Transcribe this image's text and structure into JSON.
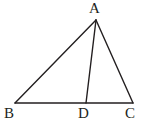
{
  "figure": {
    "type": "geometry-diagram",
    "background_color": "#ffffff",
    "stroke_color": "#231f20",
    "stroke_width": 1.4,
    "canvas": {
      "width": 145,
      "height": 126
    },
    "points": [
      {
        "id": "A",
        "label": "A",
        "x": 96,
        "y": 20,
        "label_x": 89,
        "label_y": 1
      },
      {
        "id": "B",
        "label": "B",
        "x": 15,
        "y": 103,
        "label_x": 4,
        "label_y": 106
      },
      {
        "id": "D",
        "label": "D",
        "x": 86,
        "y": 103,
        "label_x": 78,
        "label_y": 106
      },
      {
        "id": "C",
        "label": "C",
        "x": 133,
        "y": 103,
        "label_x": 125,
        "label_y": 106
      }
    ],
    "segments": [
      {
        "id": "AB",
        "name": "side-ab",
        "from": "A",
        "to": "B"
      },
      {
        "id": "AC",
        "name": "side-ac",
        "from": "A",
        "to": "C"
      },
      {
        "id": "BC",
        "name": "side-bc-base",
        "from": "B",
        "to": "C"
      },
      {
        "id": "AD",
        "name": "cevian-ad",
        "from": "A",
        "to": "D"
      }
    ]
  }
}
